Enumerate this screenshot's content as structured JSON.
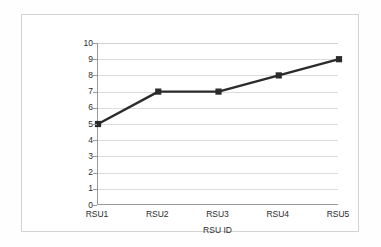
{
  "chart_data": {
    "type": "line",
    "title": "",
    "xlabel": "RSU ID",
    "ylabel": "Number of total transmitted packets",
    "categories": [
      "RSU1",
      "RSU2",
      "RSU3",
      "RSU4",
      "RSU5"
    ],
    "values": [
      5,
      7,
      7,
      8,
      9
    ],
    "series": [
      {
        "name": "Number of total transmitted packets",
        "values": [
          5,
          7,
          7,
          8,
          9
        ]
      }
    ],
    "ylim": [
      0,
      10
    ],
    "ytick_labels": [
      "0",
      "1",
      "2",
      "3",
      "4",
      "5",
      "6",
      "7",
      "8",
      "9",
      "10"
    ],
    "ytick_values": [
      0,
      1,
      2,
      3,
      4,
      5,
      6,
      7,
      8,
      9,
      10
    ],
    "grid": "horizontal",
    "legend": "none",
    "marker": "square",
    "colors": {
      "line": "#2b2b2b",
      "marker": "#2b2b2b",
      "gridline": "#dcdcdc",
      "axis": "#9a9a9a",
      "plot_background": "#ffffff",
      "frame_border": "#d3d3d3",
      "text": "#2b2b2b"
    }
  }
}
